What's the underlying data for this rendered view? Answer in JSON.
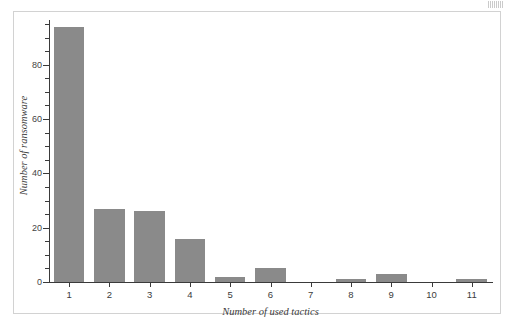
{
  "figure": {
    "background_color": "#ffffff",
    "frame_color": "#d2d2d2",
    "scan_mark": ""
  },
  "chart_data": {
    "type": "bar",
    "title": "",
    "subtitle": "",
    "xlabel": "Number of used tactics",
    "ylabel": "Number of ransomware",
    "categories": [
      "1",
      "2",
      "3",
      "4",
      "5",
      "6",
      "7",
      "8",
      "9",
      "10",
      "11"
    ],
    "values": [
      94,
      27,
      26,
      16,
      2,
      5,
      0,
      1,
      3,
      0,
      1
    ],
    "series": [
      {
        "name": "Number of ransomware",
        "values": [
          94,
          27,
          26,
          16,
          2,
          5,
          0,
          1,
          3,
          0,
          1
        ],
        "color": "#8a8a8a"
      }
    ],
    "ylim": [
      0,
      95
    ],
    "xlim": [
      0.5,
      11.5
    ],
    "y_major_ticks": [
      0,
      20,
      40,
      60,
      80
    ],
    "y_tick_labels": [
      "0",
      "20",
      "40",
      "60",
      "80"
    ],
    "y_minor_tick_interval": 5,
    "x_tick_labels": [
      "1",
      "2",
      "3",
      "4",
      "5",
      "6",
      "7",
      "8",
      "9",
      "10",
      "11"
    ],
    "grid": false,
    "legend": null,
    "legend_position": "none",
    "bar_color": "#8a8a8a",
    "axis_color": "#3a3a3a",
    "annotations": []
  }
}
